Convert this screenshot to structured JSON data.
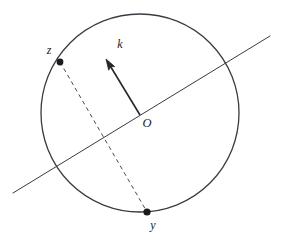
{
  "diagram": {
    "type": "geometry-circle-diagram",
    "background_color": "#ffffff",
    "stroke_color": "#3a3a42",
    "label_color": "#1a1a1a",
    "canvas": {
      "width": 285,
      "height": 241
    },
    "circle": {
      "name": "main-circle",
      "center_x": 140,
      "center_y": 113,
      "radius": 99,
      "stroke_width": 1.3,
      "fill": "none"
    },
    "center_point": {
      "name": "center-O",
      "x": 140,
      "y": 115,
      "label": "O",
      "label_x": 147,
      "label_y": 124
    },
    "points": [
      {
        "id": "z",
        "label": "z",
        "x": 60,
        "y": 62,
        "radius": 3.4,
        "label_x": 49,
        "label_y": 51
      },
      {
        "id": "y",
        "label": "y",
        "x": 147,
        "y": 212,
        "radius": 3.6,
        "label_x": 153,
        "label_y": 226
      }
    ],
    "vector": {
      "id": "k",
      "label": "k",
      "from_x": 140,
      "from_y": 115,
      "to_x": 106,
      "to_y": 59,
      "head_length": 11,
      "head_width": 7,
      "stroke_width": 1.6,
      "label_x": 120,
      "label_y": 45
    },
    "secant_line": {
      "name": "secant-line",
      "x1": 13,
      "y1": 193,
      "x2": 270,
      "y2": 36,
      "stroke_width": 1.0
    },
    "dashed_chord": {
      "name": "chord-z-to-y",
      "x1": 60,
      "y1": 62,
      "x2": 147,
      "y2": 212,
      "stroke_width": 1.0,
      "dash_pattern": "4,3.5"
    }
  }
}
